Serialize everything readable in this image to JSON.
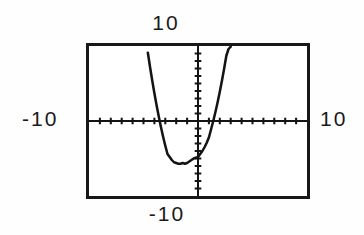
{
  "figure": {
    "kind": "graphing-calculator-screen",
    "background_color": "#fefefe",
    "ink_color": "#141414",
    "frame_color": "#181818"
  },
  "labels": {
    "top": "10",
    "left": "-10",
    "right": "10",
    "bottom": "-10"
  },
  "chart_data": {
    "type": "line",
    "title": "",
    "xlabel": "",
    "ylabel": "",
    "xlim": [
      -10,
      10
    ],
    "ylim": [
      -10,
      10
    ],
    "grid": false,
    "legend": "none",
    "axes": {
      "x_axis_visible": true,
      "y_axis_visible": true,
      "x_tick_spacing": 1,
      "y_tick_spacing": 1,
      "tick_style": "short-marks-on-axis",
      "x_tick_values": [
        -9,
        -8,
        -7,
        -6,
        -5,
        -4,
        -3,
        -2,
        -1,
        1,
        2,
        3,
        4,
        5,
        6,
        7,
        8,
        9
      ],
      "y_tick_values": [
        -9,
        -8,
        -7,
        -6,
        -5,
        -4,
        -3,
        -2,
        -1,
        1,
        2,
        3,
        4,
        5,
        6,
        7,
        8,
        9
      ]
    },
    "annotations": {
      "window_xmin": "-10",
      "window_xmax": "10",
      "window_ymin": "-10",
      "window_ymax": "10"
    },
    "series": [
      {
        "name": "parabola",
        "shape": "upward-opening parabola",
        "vertex": [
          -1.2,
          -5.7
        ],
        "x_intercepts": [
          -3.4,
          1.4
        ],
        "y_intercept": -4.8,
        "x": [
          -4.6,
          -4.4,
          -4.2,
          -4.0,
          -3.8,
          -3.6,
          -3.4,
          -3.2,
          -3.0,
          -2.8,
          -2.6,
          -2.4,
          -2.2,
          -2.0,
          -1.8,
          -1.6,
          -1.4,
          -1.2,
          -1.0,
          -0.8,
          -0.6,
          -0.4,
          -0.2,
          0.0,
          0.2,
          0.4,
          0.6,
          0.8,
          1.0,
          1.2,
          1.4,
          1.6,
          1.8,
          2.0,
          2.2,
          2.4,
          2.6,
          2.8,
          3.0
        ],
        "y": [
          9.1,
          7.2,
          5.4,
          3.7,
          2.1,
          0.6,
          -0.8,
          -2.1,
          -3.3,
          -4.4,
          -4.8,
          -5.2,
          -5.5,
          -5.6,
          -5.7,
          -5.7,
          -5.6,
          -5.7,
          -5.6,
          -5.4,
          -5.2,
          -5.0,
          -4.9,
          -4.8,
          -4.4,
          -4.0,
          -3.5,
          -2.9,
          -2.2,
          -1.1,
          0.0,
          1.2,
          2.5,
          3.9,
          5.4,
          7.0,
          8.7,
          9.6,
          9.9
        ]
      }
    ]
  }
}
